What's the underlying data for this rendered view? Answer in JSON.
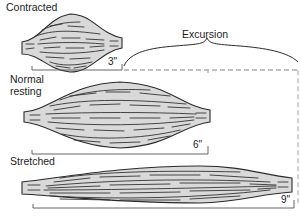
{
  "diagram": {
    "states": [
      {
        "id": "contracted",
        "label": "Contracted",
        "length": "3\""
      },
      {
        "id": "normal",
        "label_line1": "Normal",
        "label_line2": "resting",
        "length": "6\""
      },
      {
        "id": "stretched",
        "label": "Stretched",
        "length": "9\""
      }
    ],
    "excursion_label": "Excursion",
    "colors": {
      "muscle_fill": "#d9d9d9",
      "fiber_stroke": "#333333",
      "outline_stroke": "#2a2a2a",
      "measure_stroke": "#555555",
      "dashed_stroke": "#777777"
    }
  }
}
